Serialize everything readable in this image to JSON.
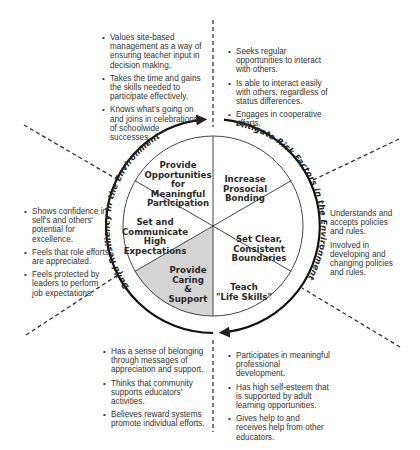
{
  "colors": {
    "ink": "#222222",
    "shaded_segment": "#d4d4d4",
    "background": "#ffffff"
  },
  "ring": {
    "left_label": "Build Resiliency in the Environment",
    "right_label": "Mitigate Risk Factors in the Environment"
  },
  "segments": [
    {
      "id": "opportunities",
      "lines": [
        "Provide",
        "Opportunities",
        "for",
        "Meaningful",
        "Participation"
      ],
      "shaded": false
    },
    {
      "id": "bonding",
      "lines": [
        "Increase",
        "Prosocial",
        "Bonding"
      ],
      "shaded": false
    },
    {
      "id": "boundaries",
      "lines": [
        "Set Clear,",
        "Consistent",
        "Boundaries"
      ],
      "shaded": false
    },
    {
      "id": "life-skills",
      "lines": [
        "Teach",
        "\"Life Skills\""
      ],
      "shaded": false
    },
    {
      "id": "caring",
      "lines": [
        "Provide",
        "Caring",
        "&",
        "Support"
      ],
      "shaded": true
    },
    {
      "id": "expectations",
      "lines": [
        "Set and",
        "Communicate",
        "High",
        "Expectations"
      ],
      "shaded": false
    }
  ],
  "callouts": {
    "top_left": [
      "Values site-based management as a way of ensuring teacher input in decision making.",
      "Takes the time and gains the skills needed to participate effectively.",
      "Knows what's going on and joins in celebrations of schoolwide successes."
    ],
    "top_right": [
      "Seeks regular opportunities to interact with others.",
      "Is able to interact easily with others, regardless of status differences.",
      "Engages in cooperative efforts."
    ],
    "left": [
      "Shows confidence in self's and others' potential for excellence.",
      "Feels that role efforts are appreciated.",
      "Feels protected by leaders to perform job expectations."
    ],
    "right": [
      "Understands and accepts policies and rules.",
      "Involved in developing and changing policies and rules."
    ],
    "bottom_left": [
      "Has a sense of belonging through messages of appreciation and support.",
      "Thinks that community supports educators' activities.",
      "Believes reward systems promote individual efforts."
    ],
    "bottom_right": [
      "Participates in meaningful professional development.",
      "Has high self-esteem that is supported by adult learning opportunities.",
      "Gives help to and receives help from other educators."
    ]
  }
}
